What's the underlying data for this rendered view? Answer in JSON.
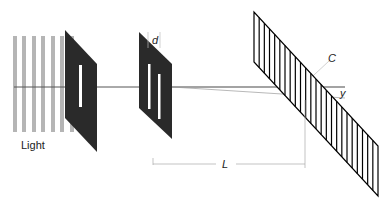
{
  "diagram": {
    "type": "double-slit-experiment",
    "labels": {
      "light": "Light",
      "slit_separation": "d",
      "screen_distance": "L",
      "screen": "C",
      "displacement": "y"
    },
    "colors": {
      "light_bars": "#b5b5b5",
      "plates": "#2a2a2a",
      "guide_lines": "#9a9a9a",
      "screen_stripes": "#000000"
    },
    "components": [
      {
        "name": "light-source",
        "bars": 6
      },
      {
        "name": "single-slit-plate",
        "slits": 1
      },
      {
        "name": "double-slit-plate",
        "slits": 2
      },
      {
        "name": "screen",
        "stripes": 24
      }
    ]
  }
}
